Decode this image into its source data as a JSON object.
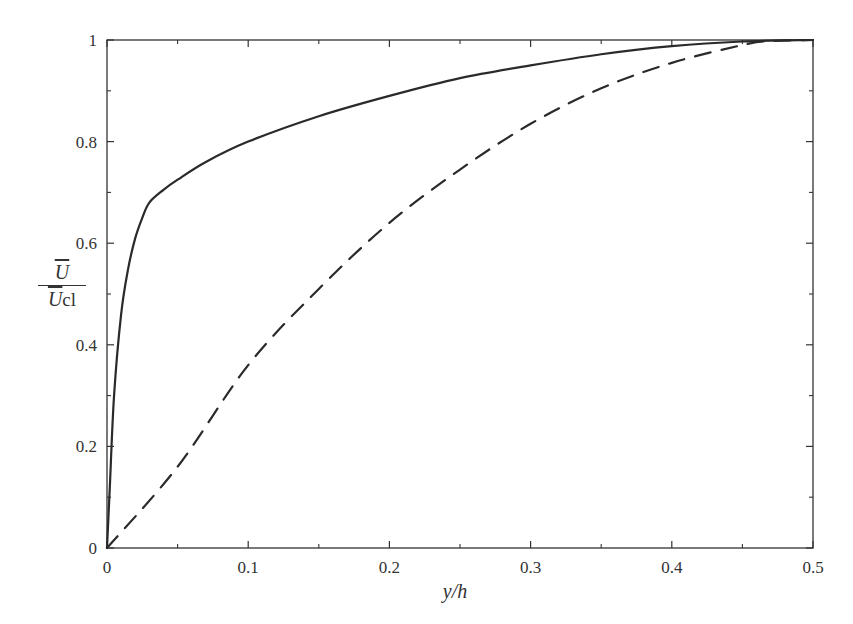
{
  "chart_data": {
    "type": "line",
    "title": "",
    "xlabel": "y/h",
    "ylabel": "Ū / Ū_cl",
    "ylabel_parts": {
      "numerator": "U",
      "denominator": "U",
      "subscript": "cl"
    },
    "xlim": [
      0,
      0.5
    ],
    "ylim": [
      0,
      1
    ],
    "xticks": [
      "0",
      "0.1",
      "0.2",
      "0.3",
      "0.4",
      "0.5"
    ],
    "yticks": [
      "0",
      "0.2",
      "0.4",
      "0.6",
      "0.8",
      "1"
    ],
    "grid": false,
    "legend": null,
    "series": [
      {
        "name": "solid",
        "style": "solid",
        "x": [
          0,
          0.002,
          0.005,
          0.01,
          0.015,
          0.02,
          0.025,
          0.03,
          0.04,
          0.05,
          0.07,
          0.1,
          0.15,
          0.2,
          0.25,
          0.3,
          0.35,
          0.4,
          0.45,
          0.5
        ],
        "y": [
          0,
          0.12,
          0.3,
          0.46,
          0.55,
          0.61,
          0.65,
          0.68,
          0.705,
          0.725,
          0.76,
          0.8,
          0.85,
          0.89,
          0.925,
          0.95,
          0.972,
          0.988,
          0.997,
          1.0
        ]
      },
      {
        "name": "dashed",
        "style": "dashed",
        "x": [
          0,
          0.05,
          0.1,
          0.15,
          0.2,
          0.25,
          0.3,
          0.35,
          0.4,
          0.45,
          0.47,
          0.5
        ],
        "y": [
          0,
          0.16,
          0.36,
          0.51,
          0.64,
          0.745,
          0.835,
          0.905,
          0.955,
          0.99,
          0.998,
          1.0
        ]
      }
    ]
  }
}
